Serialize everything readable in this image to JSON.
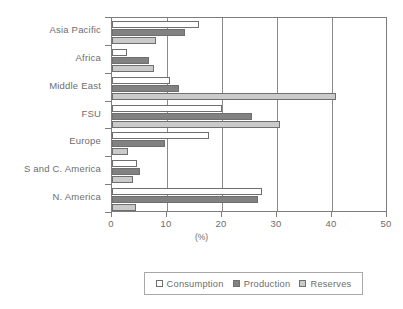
{
  "chart_data": {
    "type": "bar",
    "orientation": "horizontal",
    "title": "",
    "xlabel": "(%)",
    "ylabel": "",
    "xlim": [
      0,
      50
    ],
    "xticks": [
      0,
      10,
      20,
      30,
      40,
      50
    ],
    "grid": true,
    "grid_axis": "x",
    "legend_position": "bottom",
    "categories": [
      "Asia Pacific",
      "Africa",
      "Middle East",
      "FSU",
      "Europe",
      "S and C. America",
      "N. America"
    ],
    "series": [
      {
        "name": "Consumption",
        "color": "#ffffff",
        "values": [
          15.8,
          2.7,
          10.5,
          20.0,
          17.6,
          4.5,
          27.3
        ]
      },
      {
        "name": "Production",
        "color": "#818181",
        "values": [
          13.2,
          6.7,
          12.2,
          25.5,
          9.6,
          5.0,
          26.6
        ]
      },
      {
        "name": "Reserves",
        "color": "#cacaca",
        "values": [
          8.0,
          7.6,
          40.7,
          30.5,
          2.9,
          3.8,
          4.3
        ]
      }
    ]
  },
  "legend": {
    "items": [
      {
        "label": "Consumption",
        "swatch": "#ffffff"
      },
      {
        "label": "Production",
        "swatch": "#818181"
      },
      {
        "label": "Reserves",
        "swatch": "#cacaca"
      }
    ]
  },
  "axis": {
    "x_title": "(%)",
    "x_tick_labels": [
      "0",
      "10",
      "20",
      "30",
      "40",
      "50"
    ]
  }
}
